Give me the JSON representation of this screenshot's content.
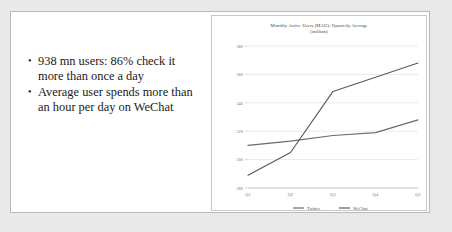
{
  "slide": {
    "bullets": [
      "938 mn users: 86% check it more than once a day",
      "Average user spends more than an hour per day on WeChat"
    ],
    "bullet_marker": "•"
  },
  "chart_data": {
    "type": "line",
    "title": "Monthly Active Users (MAU): Quarterly Average (million)",
    "title_line1": "Monthly Active Users (MAU): Quarterly Average",
    "title_line2": "(million)",
    "xlabel": "",
    "ylabel": "",
    "categories": [
      "Q1",
      "Q2",
      "Q3",
      "Q4",
      "Q1"
    ],
    "yticks": [
      280,
      300,
      320,
      340,
      360,
      380
    ],
    "ylim": [
      280,
      380
    ],
    "grid": true,
    "legend_position": "bottom",
    "series": [
      {
        "name": "Twitter",
        "color": "#6b6b6b",
        "values": [
          310,
          313,
          317,
          319,
          328
        ]
      },
      {
        "name": "WeChat",
        "color": "#5a5a5a",
        "values": [
          289,
          305,
          348,
          358,
          368
        ]
      }
    ]
  }
}
